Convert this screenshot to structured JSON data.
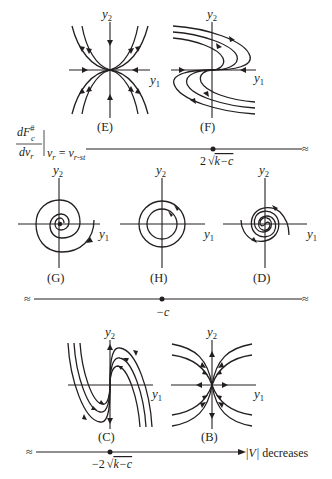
{
  "figure": {
    "axis_labels": {
      "y1": "y",
      "y1_sub": "1",
      "y2": "y",
      "y2_sub": "2"
    },
    "row1": {
      "panels": [
        {
          "id": "E",
          "caption": "(E)",
          "type": "stable node (improper/degenerate), trajectories tangent to y1 axis"
        },
        {
          "id": "F",
          "caption": "(F)",
          "type": "degenerate node, S-shaped trajectories"
        }
      ],
      "numberline": {
        "left_label_numerator": "dF",
        "left_label_numerator_sup": "#",
        "left_label_numerator_sub": "c",
        "left_label_denominator": "dv",
        "left_label_denominator_sub": "r",
        "eval_lhs": "v",
        "eval_lhs_sub": "r",
        "eval_eq": "=",
        "eval_rhs": "v",
        "eval_rhs_sub": "r-st",
        "point_label": "2 √k−c",
        "point_label_coeff": "2",
        "point_label_sqrt": "√",
        "point_label_radicand": "k−c",
        "break_symbol": "≈"
      }
    },
    "row2": {
      "panels": [
        {
          "id": "G",
          "caption": "(G)",
          "type": "stable spiral focus"
        },
        {
          "id": "H",
          "caption": "(H)",
          "type": "center (closed orbits)"
        },
        {
          "id": "D",
          "caption": "(D)",
          "type": "unstable spiral focus"
        }
      ],
      "numberline": {
        "point_label": "−c",
        "break_symbol_left": "≈",
        "break_symbol_right": "≈"
      }
    },
    "row3": {
      "panels": [
        {
          "id": "C",
          "caption": "(C)",
          "type": "degenerate node, N-shaped trajectories"
        },
        {
          "id": "B",
          "caption": "(B)",
          "type": "unstable node, trajectories tangent to y2 axis"
        }
      ],
      "numberline": {
        "point_label": "−2 √k−c",
        "point_label_coeff": "−2",
        "point_label_sqrt": "√",
        "point_label_radicand": "k−c",
        "arrow_label_bar_left": "|",
        "arrow_label_var": "V",
        "arrow_label_bar_right": "|",
        "arrow_label_text": "decreases",
        "break_symbol": "≈"
      }
    }
  }
}
